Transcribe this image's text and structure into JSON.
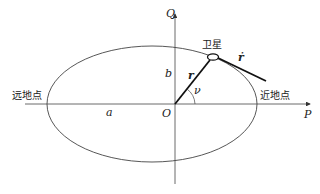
{
  "diagram": {
    "title": "",
    "axes": {
      "horizontal_label": "P",
      "vertical_label": "Q",
      "origin_label": "O"
    },
    "labels": {
      "apogee": "远地点",
      "perigee": "近地点",
      "satellite": "卫星",
      "semi_major_axis": "a",
      "semi_minor_axis": "b",
      "radius_vector": "r",
      "velocity_vector": "ṙ",
      "true_anomaly": "ν"
    },
    "colors": {
      "line": "#333333",
      "vector": "#111111",
      "background": "#ffffff"
    }
  }
}
